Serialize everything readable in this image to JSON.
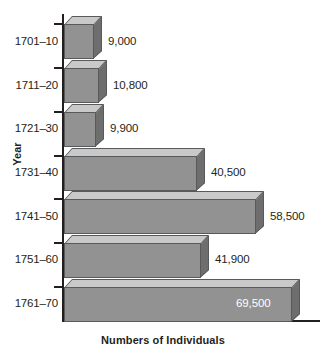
{
  "chart_data": {
    "type": "bar",
    "orientation": "horizontal",
    "title": "",
    "xlabel": "Numbers of Individuals",
    "ylabel": "Year",
    "categories": [
      "1701–10",
      "1711–20",
      "1721–30",
      "1731–40",
      "1741–50",
      "1751–60",
      "1761–70"
    ],
    "values": [
      9000,
      10800,
      9900,
      40500,
      58500,
      41900,
      69500
    ],
    "value_labels": [
      "9,000",
      "10,800",
      "9,900",
      "40,500",
      "58,500",
      "41,900",
      "69,500"
    ],
    "xlim": [
      0,
      75000
    ],
    "grid": false,
    "legend": null,
    "style": {
      "bar_face_color": "#929292",
      "bar_top_color": "#c9c9c9",
      "bar_side_color": "#6e6e6e",
      "bar_edge_color": "#58595b",
      "axis_color": "#231f20",
      "text_color": "#231f20",
      "inside_label_color": "#ffffff",
      "background": "#ffffff"
    }
  }
}
